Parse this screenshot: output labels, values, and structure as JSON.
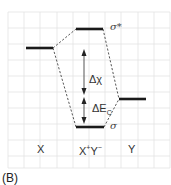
{
  "figure": {
    "panel_label": "(B)",
    "grid": {
      "x0": 8,
      "y0": 12,
      "x1": 170,
      "y1": 168,
      "spacing": 16,
      "color": "#e3e3e3"
    },
    "colors": {
      "level": "#1a1a1a",
      "dashed": "#444444",
      "arrow": "#555555",
      "text": "#333333"
    },
    "levels": [
      {
        "id": "X",
        "x1": 26,
        "x2": 53,
        "y": 48
      },
      {
        "id": "sigma_star",
        "x1": 76,
        "x2": 103,
        "y": 29
      },
      {
        "id": "sigma",
        "x1": 76,
        "x2": 104,
        "y": 127
      },
      {
        "id": "Y",
        "x1": 119,
        "x2": 146,
        "y": 99
      }
    ],
    "level_labels": {
      "sigma_star": "σ*",
      "sigma": "σ"
    },
    "arrow_labels": {
      "delta_chi": "Δχ",
      "delta_ec": "ΔE",
      "delta_ec_sub": "C"
    },
    "axis_labels": {
      "left": "X",
      "middle_x": "X",
      "middle_plus": "+",
      "middle_y": "Y",
      "middle_minus": "−",
      "right": "Y"
    }
  }
}
